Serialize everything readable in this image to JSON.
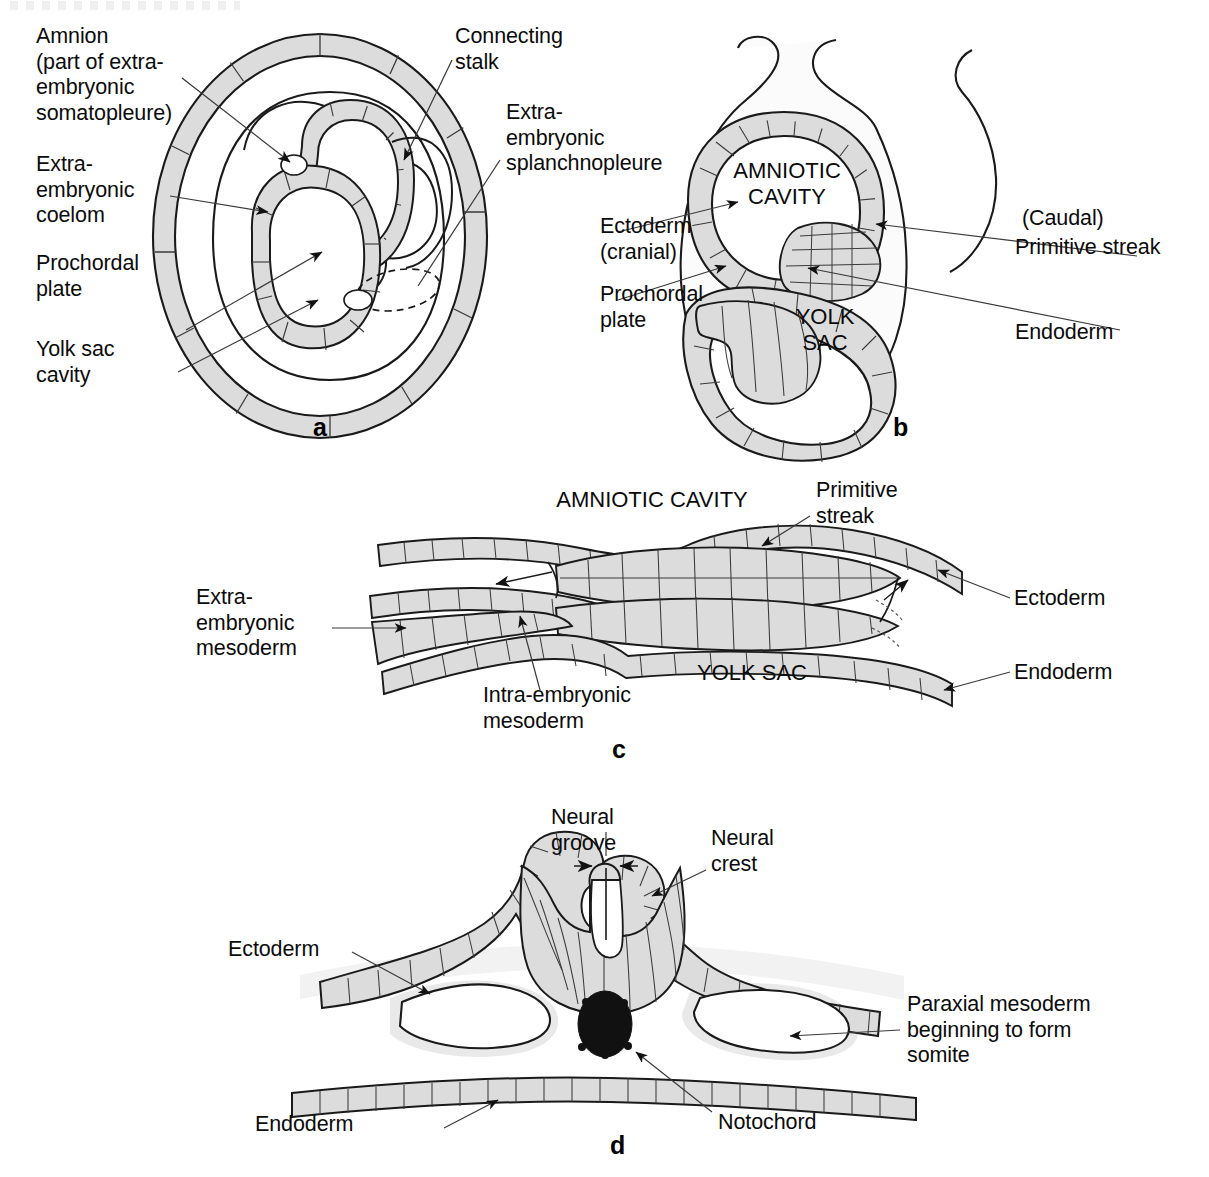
{
  "figure": {
    "background_color": "#ffffff",
    "cell_fill_color": "#dcdcdc",
    "line_color": "#1a1a1a",
    "notochord_color": "#111111"
  },
  "panels": [
    {
      "id": "a",
      "letter": "a",
      "caption": "Transverse section of conceptus showing amnion, extra-embryonic coelom and yolk sac",
      "labels": [
        {
          "name": "amnion",
          "text": "Amnion\n(part of extra-\nembryonic\nsomatopleure)"
        },
        {
          "name": "extra-embryonic-coelom",
          "text": "Extra-\nembryonic\ncoelom"
        },
        {
          "name": "prochordal-plate",
          "text": "Prochordal\nplate"
        },
        {
          "name": "yolk-sac-cavity",
          "text": "Yolk sac\ncavity"
        },
        {
          "name": "connecting-stalk",
          "text": "Connecting\nstalk"
        },
        {
          "name": "extra-embryonic-splanchnopleure",
          "text": "Extra-\nembryonic\nsplanchnopleure"
        }
      ]
    },
    {
      "id": "b",
      "letter": "b",
      "caption": "Sagittal section of embryonic disc with amniotic cavity and yolk sac",
      "labels": [
        {
          "name": "ectoderm-cranial",
          "text": "Ectoderm\n(cranial)"
        },
        {
          "name": "prochordal-plate",
          "text": "Prochordal\nplate"
        },
        {
          "name": "caudal",
          "text": "(Caudal)"
        },
        {
          "name": "primitive-streak",
          "text": "Primitive streak"
        },
        {
          "name": "endoderm",
          "text": "Endoderm"
        }
      ],
      "cavity_labels": [
        {
          "name": "amniotic-cavity",
          "text": "AMNIOTIC\nCAVITY"
        },
        {
          "name": "yolk-sac",
          "text": "YOLK\nSAC"
        }
      ]
    },
    {
      "id": "c",
      "letter": "c",
      "caption": "Longitudinal section through primitive streak showing mesoderm migration",
      "labels": [
        {
          "name": "extra-embryonic-mesoderm",
          "text": "Extra-\nembryonic\nmesoderm"
        },
        {
          "name": "intra-embryonic-mesoderm",
          "text": "Intra-embryonic\nmesoderm"
        },
        {
          "name": "primitive-streak",
          "text": "Primitive\nstreak"
        },
        {
          "name": "ectoderm",
          "text": "Ectoderm"
        },
        {
          "name": "endoderm",
          "text": "Endoderm"
        }
      ],
      "cavity_labels": [
        {
          "name": "amniotic-cavity",
          "text": "AMNIOTIC CAVITY"
        },
        {
          "name": "yolk-sac",
          "text": "YOLK SAC"
        }
      ]
    },
    {
      "id": "d",
      "letter": "d",
      "caption": "Transverse section of embryo showing neural groove, notochord and paraxial mesoderm",
      "labels": [
        {
          "name": "neural-groove",
          "text": "Neural\ngroove"
        },
        {
          "name": "neural-crest",
          "text": "Neural\ncrest"
        },
        {
          "name": "ectoderm",
          "text": "Ectoderm"
        },
        {
          "name": "paraxial-mesoderm",
          "text": "Paraxial mesoderm\nbeginning to form\nsomite"
        },
        {
          "name": "endoderm",
          "text": "Endoderm"
        },
        {
          "name": "notochord",
          "text": "Notochord"
        }
      ]
    }
  ]
}
